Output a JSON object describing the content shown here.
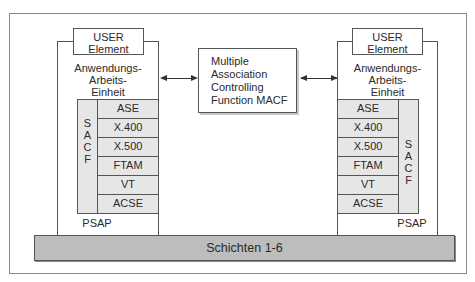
{
  "diagram": {
    "left_unit": {
      "user_element": [
        "USER",
        "Element"
      ],
      "title": [
        "Anwendungs-",
        "Arbeits-",
        "Einheit"
      ],
      "sacf_letters": [
        "S",
        "A",
        "C",
        "F"
      ],
      "layers": [
        "ASE",
        "X.400",
        "X.500",
        "FTAM",
        "VT",
        "ACSE"
      ],
      "psap": "PSAP"
    },
    "right_unit": {
      "user_element": [
        "USER",
        "Element"
      ],
      "title": [
        "Anwendungs-",
        "Arbeits-",
        "Einheit"
      ],
      "sacf_letters": [
        "S",
        "A",
        "C",
        "F"
      ],
      "layers": [
        "ASE",
        "X.400",
        "X.500",
        "FTAM",
        "VT",
        "ACSE"
      ],
      "psap": "PSAP"
    },
    "macf": [
      "Multiple",
      "Association",
      "Controlling",
      "Function  MACF"
    ],
    "base_layer": "Schichten 1-6",
    "colors": {
      "layer_fill": "#e6e6e6",
      "base_fill": "#bdbdbd",
      "line": "#555555"
    }
  }
}
